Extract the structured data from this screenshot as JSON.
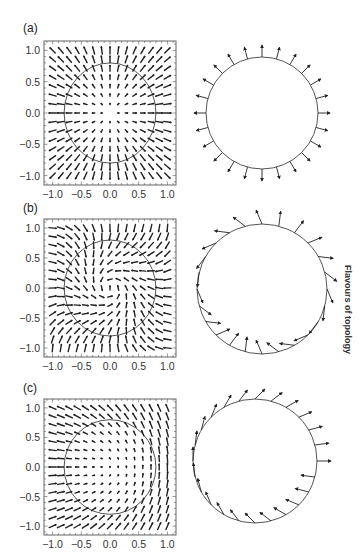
{
  "figure": {
    "side_label": "Flavours of topology",
    "colors": {
      "ink": "#222222",
      "frame": "#555555",
      "circle": "#555555",
      "background": "#ffffff"
    },
    "axis_ticks": [
      "−1.0",
      "−0.5",
      "0.0",
      "0.5",
      "1.0"
    ],
    "axis_tick_values": [
      -1.0,
      -0.5,
      0.0,
      0.5,
      1.0
    ],
    "panels": [
      {
        "label": "(a)",
        "field_type": "radial-hedgehog",
        "description": "Vector field pointing radially outward; boundary vectors all normal to circle",
        "field_frame": {
          "x": 44,
          "y": 41,
          "w": 132,
          "h": 144
        },
        "circle_in_field_radius": 0.8,
        "boundary": {
          "cx": 262,
          "cy": 113,
          "r": 56,
          "arrow_count": 24,
          "arrow_len": 12,
          "mode": "normal"
        }
      },
      {
        "label": "(b)",
        "field_type": "rotated-swirl",
        "description": "Vector field with circulating/twisted texture; boundary vectors tilted relative to circle",
        "field_frame": {
          "x": 44,
          "y": 219,
          "w": 132,
          "h": 138
        },
        "circle_in_field_radius": 0.8,
        "boundary": {
          "cx": 262,
          "cy": 289,
          "r": 65,
          "arrow_count": 24,
          "arrow_len": 15,
          "mode": "tilted"
        }
      },
      {
        "label": "(c)",
        "field_type": "half-winding",
        "description": "Vector field with vertical edges and small interior vectors; boundary vectors point rightward-dominant",
        "field_frame": {
          "x": 44,
          "y": 399,
          "w": 132,
          "h": 136
        },
        "circle_in_field_radius": 0.8,
        "boundary": {
          "cx": 255,
          "cy": 461,
          "r": 62,
          "arrow_count": 24,
          "arrow_len": 14,
          "mode": "rightward"
        }
      }
    ]
  }
}
